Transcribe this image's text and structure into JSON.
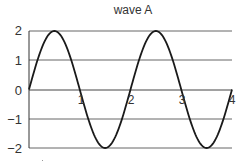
{
  "chart_data": {
    "type": "line",
    "title": "wave A",
    "xlabel": "",
    "ylabel": "",
    "xlim": [
      0,
      4
    ],
    "ylim": [
      -2,
      2
    ],
    "x_ticks": [
      "1",
      "2",
      "3",
      "4"
    ],
    "y_ticks": [
      "2",
      "1",
      "0",
      "−1",
      "−2"
    ],
    "grid": "horizontal",
    "legend": null,
    "series": [
      {
        "name": "wave A",
        "function": "y = 2*sin(pi*x)",
        "amplitude": 2,
        "period": 2,
        "x": [
          0,
          0.25,
          0.5,
          0.75,
          1,
          1.25,
          1.5,
          1.75,
          2,
          2.25,
          2.5,
          2.75,
          3,
          3.25,
          3.5,
          3.75,
          4
        ],
        "values": [
          0,
          1.41,
          2,
          1.41,
          0,
          -1.41,
          -2,
          -1.41,
          0,
          1.41,
          2,
          1.41,
          0,
          -1.41,
          -2,
          -1.41,
          0
        ]
      }
    ],
    "colors": {
      "line": "#1a1a1a",
      "grid": "#555555",
      "axis": "#333333",
      "text": "#333333"
    }
  },
  "labels": {
    "title": "wave A",
    "y": [
      "2",
      "1",
      "0",
      "−1",
      "−2"
    ],
    "x": [
      "1",
      "2",
      "3",
      "4"
    ]
  }
}
